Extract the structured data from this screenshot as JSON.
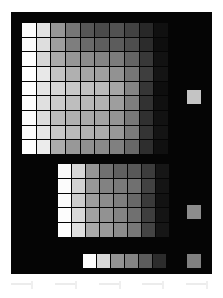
{
  "figure": {
    "name": "grayscale-swatch-test-chart",
    "page_background": "#ffffff",
    "panel_background": "#050505",
    "grid_line_color": "#050505"
  },
  "chart_data": {
    "type": "heatmap",
    "title": "",
    "subtitle": "",
    "xlabel": "",
    "ylabel": "",
    "grid": true,
    "legend_position": "none",
    "colormap": "grayscale",
    "value_range": [
      0,
      255
    ],
    "panels": [
      {
        "name": "primary-grid",
        "columns": 10,
        "rows": 9,
        "x_tick_labels": [],
        "y_tick_labels": [],
        "values": [
          [
            252,
            226,
            150,
            118,
            86,
            74,
            82,
            66,
            40,
            16
          ],
          [
            250,
            222,
            158,
            126,
            106,
            94,
            92,
            78,
            44,
            14
          ],
          [
            253,
            214,
            170,
            150,
            140,
            132,
            124,
            100,
            56,
            18
          ],
          [
            255,
            232,
            196,
            176,
            166,
            160,
            146,
            118,
            62,
            20
          ],
          [
            254,
            228,
            214,
            200,
            192,
            186,
            166,
            132,
            54,
            14
          ],
          [
            253,
            224,
            204,
            190,
            184,
            178,
            158,
            126,
            50,
            16
          ],
          [
            252,
            220,
            188,
            176,
            170,
            164,
            148,
            120,
            48,
            18
          ],
          [
            251,
            230,
            200,
            186,
            178,
            172,
            152,
            122,
            52,
            20
          ],
          [
            254,
            236,
            172,
            152,
            144,
            138,
            128,
            104,
            46,
            16
          ]
        ]
      },
      {
        "name": "secondary-grid",
        "columns": 8,
        "rows": 5,
        "x_tick_labels": [],
        "y_tick_labels": [],
        "values": [
          [
            250,
            214,
            150,
            112,
            96,
            88,
            60,
            22
          ],
          [
            252,
            210,
            152,
            130,
            122,
            112,
            66,
            20
          ],
          [
            251,
            204,
            158,
            140,
            126,
            104,
            58,
            18
          ],
          [
            253,
            216,
            162,
            146,
            132,
            112,
            62,
            20
          ],
          [
            254,
            222,
            170,
            154,
            140,
            120,
            68,
            22
          ]
        ]
      },
      {
        "name": "strip-grid",
        "columns": 6,
        "rows": 1,
        "x_tick_labels": [],
        "y_tick_labels": [],
        "values": [
          [
            253,
            216,
            148,
            132,
            92,
            44
          ]
        ]
      }
    ],
    "reference_patches": [
      {
        "name": "reference-patch-light",
        "value": 196
      },
      {
        "name": "reference-patch-mid",
        "value": 140
      },
      {
        "name": "reference-patch-dark",
        "value": 128
      }
    ]
  },
  "footer": {
    "marks": [
      {
        "name": "footer-mark-1"
      },
      {
        "name": "footer-mark-2"
      },
      {
        "name": "footer-mark-3"
      },
      {
        "name": "footer-mark-4"
      },
      {
        "name": "footer-mark-5"
      }
    ]
  }
}
